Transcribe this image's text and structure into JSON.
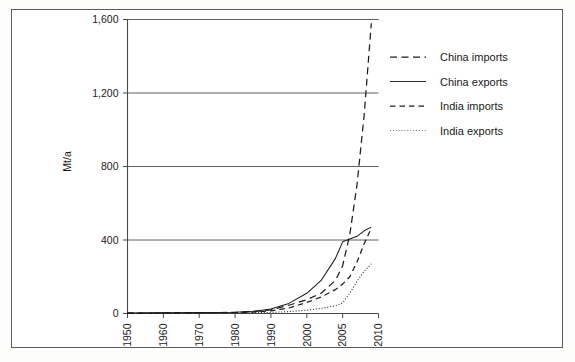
{
  "figure": {
    "name": "coal-trade-china-india-chart",
    "border_color": "#5c5c5c",
    "background": "#ffffff"
  },
  "chart_data": {
    "type": "line",
    "title": "",
    "xlabel": "",
    "ylabel": "Mt/a",
    "xlim": [
      1950,
      2010
    ],
    "ylim": [
      0,
      1600
    ],
    "grid": true,
    "legend_position": "right",
    "x_ticks": [
      "1950",
      "1960",
      "1970",
      "1980",
      "1990",
      "2000",
      "2005",
      "2010"
    ],
    "x_tick_values": [
      1950,
      1960,
      1970,
      1980,
      1990,
      2000,
      2005,
      2010
    ],
    "y_ticks": [
      "0",
      "400",
      "800",
      "1,200",
      "1,600"
    ],
    "y_tick_values": [
      0,
      400,
      800,
      1200,
      1600
    ],
    "series": [
      {
        "name": "China imports",
        "style": "long-dash",
        "color": "#1c1c1c",
        "x": [
          1950,
          1960,
          1970,
          1980,
          1985,
          1990,
          1995,
          2000,
          2002,
          2004,
          2005,
          2006,
          2007,
          2008,
          2009
        ],
        "values": [
          2,
          3,
          4,
          6,
          10,
          20,
          45,
          75,
          110,
          180,
          260,
          430,
          700,
          1080,
          1580
        ]
      },
      {
        "name": "China exports",
        "style": "solid",
        "color": "#2a2a2a",
        "x": [
          1950,
          1960,
          1970,
          1980,
          1985,
          1990,
          1995,
          2000,
          2002,
          2004,
          2005,
          2006,
          2007,
          2008,
          2009
        ],
        "values": [
          2,
          4,
          5,
          7,
          12,
          25,
          55,
          110,
          180,
          300,
          390,
          405,
          420,
          450,
          470
        ]
      },
      {
        "name": "India imports",
        "style": "dash",
        "color": "#1c1c1c",
        "x": [
          1950,
          1960,
          1970,
          1980,
          1985,
          1990,
          1995,
          2000,
          2002,
          2004,
          2005,
          2006,
          2007,
          2008,
          2009
        ],
        "values": [
          2,
          3,
          4,
          5,
          8,
          14,
          30,
          60,
          90,
          130,
          160,
          200,
          280,
          380,
          465
        ]
      },
      {
        "name": "India exports",
        "style": "dotted",
        "color": "#6a6a6a",
        "x": [
          1950,
          1960,
          1970,
          1980,
          1985,
          1990,
          1995,
          2000,
          2002,
          2004,
          2005,
          2006,
          2007,
          2008,
          2009
        ],
        "values": [
          1,
          2,
          2,
          3,
          4,
          6,
          10,
          18,
          28,
          42,
          58,
          110,
          175,
          230,
          270
        ]
      }
    ],
    "legend_entries": [
      {
        "label": "China imports",
        "style": "long-dash"
      },
      {
        "label": "China exports",
        "style": "solid"
      },
      {
        "label": "India imports",
        "style": "dash"
      },
      {
        "label": "India exports",
        "style": "dotted"
      }
    ]
  }
}
